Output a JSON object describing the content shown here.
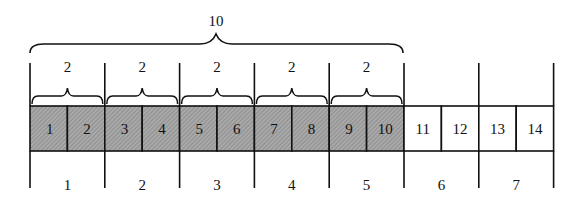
{
  "diagram": {
    "type": "segmented-array-grouping",
    "outer_brace": {
      "label": "10",
      "spans_cells": [
        1,
        10
      ]
    },
    "pair_braces": [
      {
        "label": "2",
        "cells": [
          1,
          2
        ]
      },
      {
        "label": "2",
        "cells": [
          3,
          4
        ]
      },
      {
        "label": "2",
        "cells": [
          5,
          6
        ]
      },
      {
        "label": "2",
        "cells": [
          7,
          8
        ]
      },
      {
        "label": "2",
        "cells": [
          9,
          10
        ]
      }
    ],
    "cells": [
      {
        "label": "1",
        "shaded": true
      },
      {
        "label": "2",
        "shaded": true
      },
      {
        "label": "3",
        "shaded": true
      },
      {
        "label": "4",
        "shaded": true
      },
      {
        "label": "5",
        "shaded": true
      },
      {
        "label": "6",
        "shaded": true
      },
      {
        "label": "7",
        "shaded": true
      },
      {
        "label": "8",
        "shaded": true
      },
      {
        "label": "9",
        "shaded": true
      },
      {
        "label": "10",
        "shaded": true
      },
      {
        "label": "11",
        "shaded": false
      },
      {
        "label": "12",
        "shaded": false
      },
      {
        "label": "13",
        "shaded": false
      },
      {
        "label": "14",
        "shaded": false
      }
    ],
    "groups": [
      {
        "label": "1"
      },
      {
        "label": "2"
      },
      {
        "label": "3"
      },
      {
        "label": "4"
      },
      {
        "label": "5"
      },
      {
        "label": "6"
      },
      {
        "label": "7"
      }
    ],
    "colors": {
      "shaded_fill": "#a9a9a9",
      "hatch": "#7d7d7d",
      "line": "#111111",
      "background": "#ffffff"
    }
  }
}
